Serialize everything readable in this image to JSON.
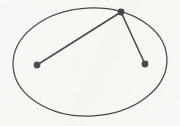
{
  "figure": {
    "title": "Ellipse with two chords from a common boundary point",
    "background_color": "#f7f6f3",
    "ink_color": "#1a1a1a",
    "canvas": {
      "width": 180,
      "height": 126
    },
    "ellipse": {
      "label": "ellipse-outline",
      "center_x": 90,
      "center_y": 62,
      "radius_x": 77,
      "radius_y": 54,
      "rotation_deg": -3,
      "stroke_width": 1.3,
      "fill": "none"
    },
    "points": [
      {
        "id": "vertex-top",
        "label": "top vertex point",
        "x": 121,
        "y": 12,
        "radius": 3.4
      },
      {
        "id": "point-left",
        "label": "left point",
        "x": 37,
        "y": 65,
        "radius": 3.4
      },
      {
        "id": "point-right",
        "label": "right point",
        "x": 145,
        "y": 64,
        "radius": 3.4
      }
    ],
    "segments": [
      {
        "id": "segment-long",
        "label": "chord from top vertex to left point",
        "x1": 121,
        "y1": 12,
        "x2": 37,
        "y2": 65,
        "stroke_width": 1.5
      },
      {
        "id": "segment-short",
        "label": "chord from top vertex to right point",
        "x1": 121,
        "y1": 12,
        "x2": 145,
        "y2": 64,
        "stroke_width": 1.5
      }
    ]
  }
}
